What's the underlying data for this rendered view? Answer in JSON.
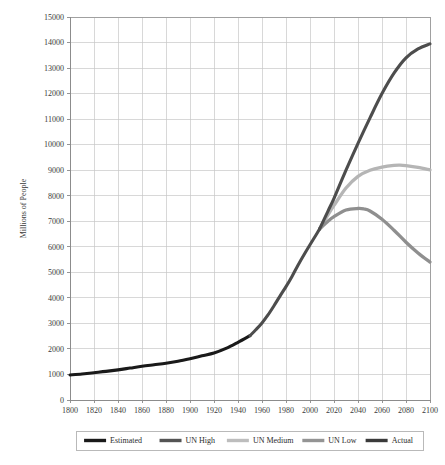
{
  "chart_data": {
    "type": "line",
    "title": "",
    "subtitle": "",
    "xlabel": "",
    "ylabel": "Millions of People",
    "xlim": [
      1800,
      2100
    ],
    "ylim": [
      0,
      15000
    ],
    "grid": true,
    "legend_position": "bottom",
    "x_ticks": [
      1800,
      1820,
      1840,
      1860,
      1880,
      1900,
      1920,
      1940,
      1960,
      1980,
      2000,
      2020,
      2040,
      2060,
      2080,
      2100
    ],
    "x_tick_labels": [
      "1800",
      "1820",
      "1840",
      "1860",
      "1880",
      "1900",
      "1920",
      "1940",
      "1960",
      "1980",
      "2000",
      "2020",
      "2040",
      "2060",
      "2080",
      "2100"
    ],
    "y_ticks": [
      0,
      1000,
      2000,
      3000,
      4000,
      5000,
      6000,
      7000,
      8000,
      9000,
      10000,
      11000,
      12000,
      13000,
      14000,
      15000
    ],
    "y_tick_labels": [
      "0",
      "1000",
      "2000",
      "3000",
      "4000",
      "5000",
      "6000",
      "7000",
      "8000",
      "9000",
      "10000",
      "11000",
      "12000",
      "13000",
      "14000",
      "15000"
    ],
    "series": [
      {
        "name": "Estimated",
        "color": "#1a1a1a",
        "width": 3.1,
        "x": [
          1800,
          1810,
          1820,
          1830,
          1840,
          1850,
          1860,
          1870,
          1880,
          1890,
          1900,
          1910,
          1920,
          1930,
          1940,
          1950
        ],
        "values": [
          980,
          1020,
          1070,
          1120,
          1180,
          1250,
          1320,
          1380,
          1440,
          1520,
          1620,
          1730,
          1840,
          2020,
          2260,
          2520
        ]
      },
      {
        "name": "Actual",
        "color": "#4d4d4d",
        "width": 3.1,
        "x": [
          1950,
          1955,
          1960,
          1965,
          1970,
          1975,
          1980,
          1985,
          1990,
          1995,
          2000,
          2005,
          2008
        ],
        "values": [
          2520,
          2760,
          3020,
          3330,
          3690,
          4070,
          4440,
          4840,
          5280,
          5690,
          6080,
          6460,
          6700
        ]
      },
      {
        "name": "UN High",
        "color": "#4d4d4d",
        "width": 3.1,
        "x": [
          2008,
          2015,
          2020,
          2030,
          2040,
          2050,
          2060,
          2070,
          2080,
          2090,
          2100
        ],
        "values": [
          6700,
          7400,
          7900,
          9000,
          10050,
          11050,
          12000,
          12800,
          13400,
          13750,
          13950
        ]
      },
      {
        "name": "UN Medium",
        "color": "#b5b5b5",
        "width": 3.3,
        "x": [
          2008,
          2015,
          2020,
          2030,
          2040,
          2050,
          2060,
          2070,
          2075,
          2080,
          2090,
          2100
        ],
        "values": [
          6700,
          7250,
          7620,
          8300,
          8760,
          9000,
          9120,
          9190,
          9200,
          9180,
          9110,
          9010
        ]
      },
      {
        "name": "UN Low",
        "color": "#8f8f8f",
        "width": 3.3,
        "x": [
          2008,
          2015,
          2020,
          2030,
          2040,
          2045,
          2050,
          2060,
          2070,
          2080,
          2090,
          2100
        ],
        "values": [
          6700,
          7000,
          7180,
          7440,
          7500,
          7480,
          7400,
          7080,
          6650,
          6180,
          5760,
          5400
        ]
      }
    ]
  },
  "legend": {
    "items": [
      {
        "label": "Estimated",
        "color": "#1a1a1a"
      },
      {
        "label": "UN High",
        "color": "#545454"
      },
      {
        "label": "UN Medium",
        "color": "#bdbdbd"
      },
      {
        "label": "UN Low",
        "color": "#949494"
      },
      {
        "label": "Actual",
        "color": "#3a3a3a"
      }
    ]
  }
}
